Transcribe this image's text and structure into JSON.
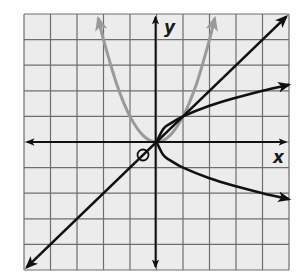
{
  "title": "",
  "colors": {
    "background": "#ffffff",
    "grid_fill": "#ececec",
    "grid_line": "#6e6e6e",
    "axis": "#111111",
    "curve_black": "#111111",
    "curve_gray": "#9a9a9a"
  },
  "axes": {
    "x_label": "x",
    "y_label": "y",
    "origin_label": "O",
    "x_range": [
      -5,
      5
    ],
    "y_range": [
      -5,
      5
    ],
    "grid_step": 1
  },
  "curves": [
    {
      "name": "parabola",
      "equation": "y = x^2",
      "color": "gray",
      "x_domain": [
        -2.2,
        2.2
      ],
      "arrows": "both-ends"
    },
    {
      "name": "identity-line",
      "equation": "y = x",
      "color": "black",
      "x_domain": [
        -5,
        5
      ],
      "arrows": "both-ends"
    },
    {
      "name": "sqrt-upper",
      "equation": "y = sqrt(x)",
      "color": "black",
      "x_domain": [
        0,
        5
      ],
      "arrows": "end"
    },
    {
      "name": "sqrt-lower",
      "equation": "y = -sqrt(x)",
      "color": "black",
      "x_domain": [
        0,
        5
      ],
      "arrows": "end"
    }
  ],
  "chart_data": {
    "type": "line",
    "title": "",
    "xlabel": "x",
    "ylabel": "y",
    "xlim": [
      -5,
      5
    ],
    "ylim": [
      -5,
      5
    ],
    "grid": true,
    "series": [
      {
        "name": "y = x^2",
        "x": [
          -2.2,
          -2,
          -1.5,
          -1,
          -0.5,
          0,
          0.5,
          1,
          1.5,
          2,
          2.2
        ],
        "y": [
          4.84,
          4,
          2.25,
          1,
          0.25,
          0,
          0.25,
          1,
          2.25,
          4,
          4.84
        ]
      },
      {
        "name": "y = x",
        "x": [
          -5,
          5
        ],
        "y": [
          -5,
          5
        ]
      },
      {
        "name": "y = sqrt(x)",
        "x": [
          0,
          0.25,
          0.5,
          1,
          2,
          3,
          4,
          5
        ],
        "y": [
          0,
          0.5,
          0.707,
          1,
          1.414,
          1.732,
          2,
          2.236
        ]
      },
      {
        "name": "y = -sqrt(x)",
        "x": [
          0,
          0.25,
          0.5,
          1,
          2,
          3,
          4,
          5
        ],
        "y": [
          0,
          -0.5,
          -0.707,
          -1,
          -1.414,
          -1.732,
          -2,
          -2.236
        ]
      }
    ],
    "annotations": [
      "O (origin marker)",
      "x",
      "y"
    ]
  }
}
